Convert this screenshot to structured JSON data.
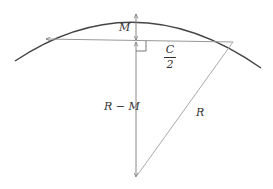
{
  "diagram": {
    "type": "circle-segment-geometry",
    "colors": {
      "arc": "#444444",
      "lines": "#888888",
      "text": "#333333"
    },
    "labels": {
      "sagitta": "M",
      "half_chord_num": "C",
      "half_chord_den": "2",
      "apothem": "R − M",
      "radius": "R"
    },
    "elements": [
      {
        "name": "arc",
        "description": "circular arc (top of circle)"
      },
      {
        "name": "chord",
        "description": "horizontal chord with arrowheads at both ends"
      },
      {
        "name": "sagitta",
        "description": "vertical double-headed arrow from chord midpoint to arc, labeled M"
      },
      {
        "name": "apothem",
        "description": "vertical line from chord midpoint down to circle center, labeled R − M"
      },
      {
        "name": "radius",
        "description": "line from center to right chord endpoint, labeled R"
      },
      {
        "name": "right-angle-marker",
        "description": "square marker at chord/vertical intersection"
      }
    ]
  }
}
